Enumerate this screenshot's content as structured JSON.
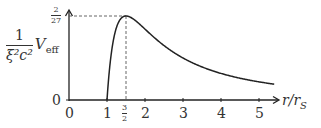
{
  "chart_data": {
    "type": "line",
    "title": "",
    "xlabel": "r/r_S",
    "ylabel": "1/(ξ²c²) V_eff",
    "xlim": [
      0,
      5.5
    ],
    "ylim": [
      0,
      0.074
    ],
    "grid": false,
    "legend": null,
    "x_ticks": [
      "0",
      "1",
      "3/2",
      "2",
      "3",
      "4",
      "5"
    ],
    "x_tick_values": [
      0,
      1,
      1.5,
      2,
      3,
      4,
      5
    ],
    "y_ticks": [
      "0",
      "2/27"
    ],
    "y_tick_values": [
      0,
      0.0741
    ],
    "series": [
      {
        "name": "V_eff",
        "formula": "(1/r)(1 - 1/r) / r ... normalized, zero at r=1, max 2/27 at r=3/2",
        "x": [
          1.0,
          1.05,
          1.1,
          1.2,
          1.3,
          1.4,
          1.5,
          1.75,
          2.0,
          2.5,
          3.0,
          3.5,
          4.0,
          4.5,
          5.0,
          5.4
        ],
        "y": [
          0.0,
          0.0432,
          0.0601,
          0.0694,
          0.0728,
          0.0739,
          0.0741,
          0.07,
          0.0625,
          0.048,
          0.037,
          0.0292,
          0.0234,
          0.0192,
          0.016,
          0.0139
        ]
      }
    ],
    "annotations": [
      {
        "type": "dashed-line",
        "from": [
          0,
          0.0741
        ],
        "to": [
          1.5,
          0.0741
        ],
        "label": "2/27"
      },
      {
        "type": "dashed-line",
        "from": [
          1.5,
          0
        ],
        "to": [
          1.5,
          0.0741
        ],
        "label": "3/2"
      }
    ]
  },
  "labels": {
    "y_num": "1",
    "y_den": "ξ²c²",
    "y_var": "V",
    "y_sub": "eff",
    "x_var": "r/r",
    "x_sub": "S",
    "peak_num": "2",
    "peak_den": "27",
    "y_zero": "0",
    "x_ticks": {
      "t0": "0",
      "t1": "1",
      "t2": "2",
      "t3": "3",
      "t4": "4",
      "t5": "5"
    },
    "half_num": "3",
    "half_den": "2"
  }
}
